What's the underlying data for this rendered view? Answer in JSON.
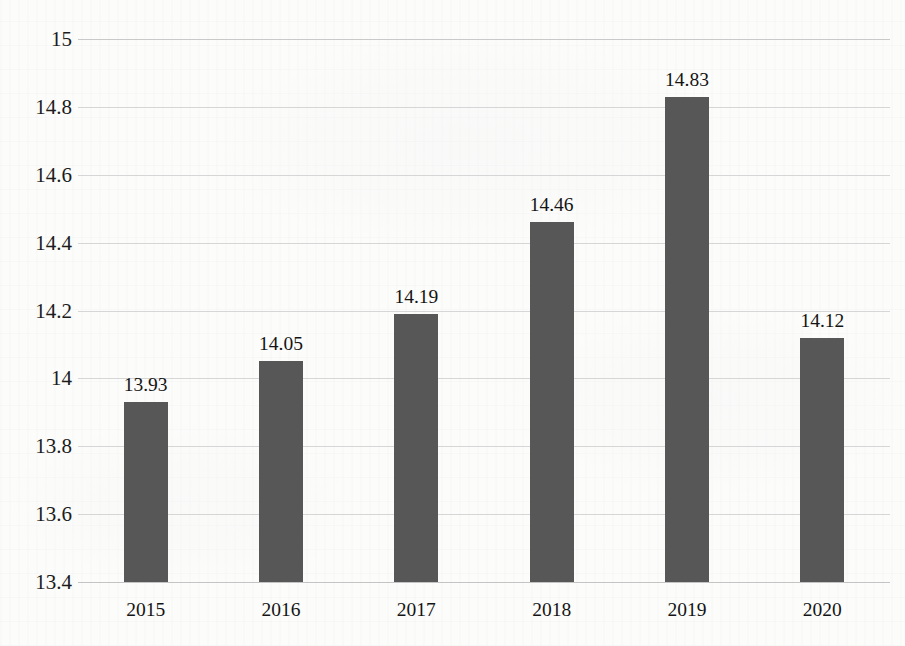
{
  "chart_data": {
    "type": "bar",
    "title": "",
    "subtitle": "",
    "xlabel": "",
    "ylabel": "",
    "categories": [
      "2015",
      "2016",
      "2017",
      "2018",
      "2019",
      "2020"
    ],
    "values": [
      13.93,
      14.05,
      14.19,
      14.46,
      14.83,
      14.12
    ],
    "data_labels": [
      "13.93",
      "14.05",
      "14.19",
      "14.46",
      "14.83",
      "14.12"
    ],
    "ylim": [
      13.4,
      15.0
    ],
    "ytick_step": 0.2,
    "ytick_labels": [
      "15",
      "14.8",
      "14.6",
      "14.4",
      "14.2",
      "14",
      "13.8",
      "13.6",
      "13.4"
    ],
    "ytick_values": [
      15,
      14.8,
      14.6,
      14.4,
      14.2,
      14,
      13.8,
      13.6,
      13.4
    ],
    "grid": true,
    "grid_axis": "y",
    "legend": null,
    "legend_position": "none",
    "bar_color": "#575757",
    "gridline_color": "#d6d6d6",
    "label_color": "#141414",
    "background_color": "#fcfcfb"
  }
}
